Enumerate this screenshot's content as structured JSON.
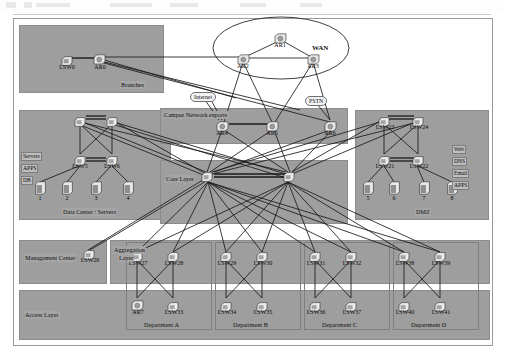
{
  "diagram": {
    "zones": [
      {
        "id": "branches",
        "label": "Branches"
      },
      {
        "id": "datacenter",
        "label": "Data Center / Servers"
      },
      {
        "id": "dmz",
        "label": "DMZ"
      },
      {
        "id": "campus_exports",
        "label": "Campus Network exports"
      },
      {
        "id": "core",
        "label": "Core Layer"
      },
      {
        "id": "aggregation",
        "label": "Aggregation\nLayer"
      },
      {
        "id": "management",
        "label": "Management Center"
      },
      {
        "id": "access",
        "label": "Access Layer"
      }
    ],
    "zone_labels": {
      "branches": "Branches",
      "datacenter": "Data Center / Servers",
      "dmz": "DMZ",
      "campus_exports": "Campus Network exports",
      "core": "Core Layer",
      "aggregation_line1": "Aggregation",
      "aggregation_line2": "Layer",
      "management": "Management Center",
      "access": "Access Layer"
    },
    "clouds": {
      "wan": "WAN",
      "internet": "Internet",
      "pstn": "PSTN"
    },
    "service_tags": {
      "datacenter": [
        "Servers",
        "APPS",
        "DB"
      ],
      "dmz": [
        "Web",
        "DNS",
        "Email",
        "APPS"
      ]
    },
    "devices": {
      "branch": [
        {
          "name": "LSW0",
          "type": "switch"
        },
        {
          "name": "AR0",
          "type": "router"
        }
      ],
      "wan": [
        {
          "name": "AR1",
          "type": "router"
        },
        {
          "name": "AR2",
          "type": "router"
        },
        {
          "name": "AR3",
          "type": "router"
        }
      ],
      "exports": [
        {
          "name": "AR4",
          "type": "router"
        },
        {
          "name": "AR5",
          "type": "router"
        },
        {
          "name": "AR6",
          "type": "router"
        }
      ],
      "datacenter_top": [
        {
          "name": "",
          "type": "switch"
        },
        {
          "name": "",
          "type": "switch"
        }
      ],
      "datacenter_access": [
        {
          "name": "LSW5",
          "type": "switch"
        },
        {
          "name": "LSW6",
          "type": "switch"
        }
      ],
      "datacenter_servers": [
        {
          "name": "1",
          "type": "server"
        },
        {
          "name": "2",
          "type": "server"
        },
        {
          "name": "3",
          "type": "server"
        },
        {
          "name": "4",
          "type": "server"
        }
      ],
      "dmz_top": [
        {
          "name": "LSW23",
          "type": "switch"
        },
        {
          "name": "LSW24",
          "type": "switch"
        }
      ],
      "dmz_access": [
        {
          "name": "LSW21",
          "type": "switch"
        },
        {
          "name": "LSW22",
          "type": "switch"
        }
      ],
      "dmz_servers": [
        {
          "name": "5",
          "type": "server"
        },
        {
          "name": "6",
          "type": "server"
        },
        {
          "name": "7",
          "type": "server"
        },
        {
          "name": "8",
          "type": "server"
        }
      ],
      "core": [
        {
          "name": "",
          "type": "switch"
        },
        {
          "name": "",
          "type": "switch"
        }
      ],
      "management": [
        {
          "name": "LSW26",
          "type": "switch"
        }
      ],
      "aggregation": [
        {
          "name": "LSW27",
          "type": "switch"
        },
        {
          "name": "LSW28",
          "type": "switch"
        },
        {
          "name": "LSW29",
          "type": "switch"
        },
        {
          "name": "LSW30",
          "type": "switch"
        },
        {
          "name": "LSW31",
          "type": "switch"
        },
        {
          "name": "LSW32",
          "type": "switch"
        },
        {
          "name": "LSW38",
          "type": "switch"
        },
        {
          "name": "LSW39",
          "type": "switch"
        }
      ],
      "access": [
        {
          "name": "AR7",
          "type": "router"
        },
        {
          "name": "LSW33",
          "type": "switch"
        },
        {
          "name": "LSW34",
          "type": "switch"
        },
        {
          "name": "LSW35",
          "type": "switch"
        },
        {
          "name": "LSW36",
          "type": "switch"
        },
        {
          "name": "LSW37",
          "type": "switch"
        },
        {
          "name": "LSW40",
          "type": "switch"
        },
        {
          "name": "LSW41",
          "type": "switch"
        }
      ]
    },
    "departments": [
      {
        "label": "Department A"
      },
      {
        "label": "Department B"
      },
      {
        "label": "Department C"
      },
      {
        "label": "Department D"
      }
    ],
    "colors": {
      "zone_fill": "#9e9e9e",
      "zone_border": "#8c8c8c",
      "line": "#1a1a1a",
      "page_bg": "#ffffff",
      "cloud_fill": "#f2f2f2"
    }
  }
}
